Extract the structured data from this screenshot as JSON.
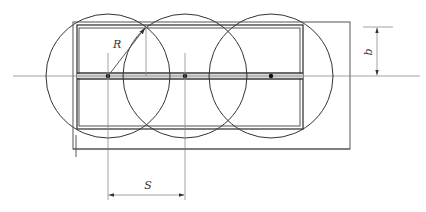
{
  "diagram": {
    "type": "engineering drawing",
    "labels": {
      "radius": "R",
      "spacing": "S",
      "half_width": "b"
    },
    "circles": [
      {
        "cx": 108,
        "cy": 76,
        "r": 62
      },
      {
        "cx": 185,
        "cy": 76,
        "r": 62
      },
      {
        "cx": 271,
        "cy": 76,
        "r": 62
      }
    ],
    "colors": {
      "line": "#333333",
      "thin_line": "#8a8a8a",
      "background": "#ffffff"
    }
  }
}
